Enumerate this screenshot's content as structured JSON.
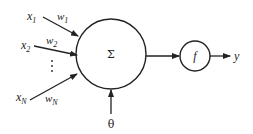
{
  "diagram": {
    "type": "perceptron / artificial neuron",
    "inputs": [
      {
        "label": "x",
        "sub": "1",
        "weight": "w",
        "weight_sub": "1"
      },
      {
        "label": "x",
        "sub": "2",
        "weight": "w",
        "weight_sub": "2"
      },
      {
        "label": "x",
        "sub": "N",
        "weight": "w",
        "weight_sub": "N"
      }
    ],
    "ellipsis": "⋮",
    "summation_symbol": "Σ",
    "threshold_label": "θ",
    "activation_label": "f",
    "output_label": "y",
    "colors": {
      "stroke": "#222222",
      "background": "#ffffff"
    }
  }
}
